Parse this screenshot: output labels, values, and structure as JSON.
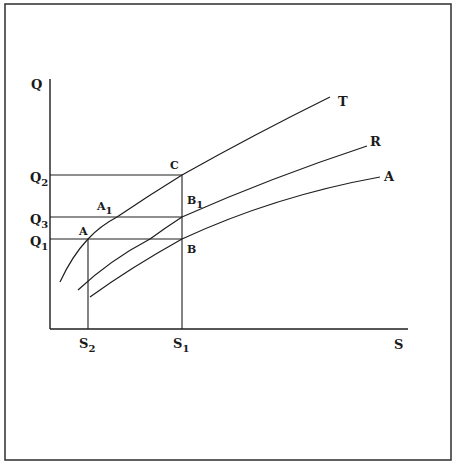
{
  "frame": {
    "border_color": "#3a3a3a"
  },
  "axes": {
    "y_label": "Q",
    "x_label": "S"
  },
  "y_ticks": [
    {
      "name": "Q2",
      "base": "Q",
      "sub": "2"
    },
    {
      "name": "Q3",
      "base": "Q",
      "sub": "3"
    },
    {
      "name": "Q1",
      "base": "Q",
      "sub": "1"
    }
  ],
  "x_ticks": [
    {
      "name": "S2",
      "base": "S",
      "sub": "2"
    },
    {
      "name": "S1",
      "base": "S",
      "sub": "1"
    }
  ],
  "curves": [
    {
      "label": "T"
    },
    {
      "label": "R"
    },
    {
      "label": "A"
    }
  ],
  "points": {
    "C": {
      "base": "C",
      "sub": ""
    },
    "A1": {
      "base": "A",
      "sub": "1"
    },
    "B1": {
      "base": "B",
      "sub": "1"
    },
    "A": {
      "base": "A",
      "sub": ""
    },
    "B": {
      "base": "B",
      "sub": ""
    }
  },
  "colors": {
    "ink": "#1e1e1e",
    "background": "#ffffff"
  }
}
